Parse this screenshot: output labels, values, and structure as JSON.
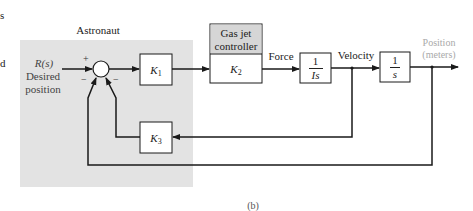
{
  "figure": {
    "caption": "(b)",
    "left_cropped_text": [
      "s",
      "d"
    ]
  },
  "astronaut_group": {
    "label": "Astronaut",
    "fill_color": "#e3e3e3"
  },
  "input": {
    "symbol": "R(s)",
    "label_line1": "Desired",
    "label_line2": "position"
  },
  "summing_junction": {
    "signs": {
      "top": "+",
      "bottom_left": "−",
      "bottom_right": "−"
    }
  },
  "blocks": {
    "k1": {
      "gain": "K",
      "subscript": "1"
    },
    "gas_jet_controller": {
      "header_line1": "Gas jet",
      "header_line2": "controller",
      "gain": "K",
      "subscript": "2",
      "header_color": "#d6d6d6"
    },
    "inertia": {
      "numerator": "1",
      "denominator": "Is"
    },
    "integrator": {
      "numerator": "1",
      "denominator": "s"
    },
    "k3": {
      "gain": "K",
      "subscript": "3"
    }
  },
  "signals": {
    "force": "Force",
    "velocity": "Velocity",
    "position_line1": "Position",
    "position_line2": "(meters)",
    "position_color": "#a9a9a9"
  },
  "colors": {
    "line": "#1a1a1a",
    "block_fill": "#ffffff"
  }
}
